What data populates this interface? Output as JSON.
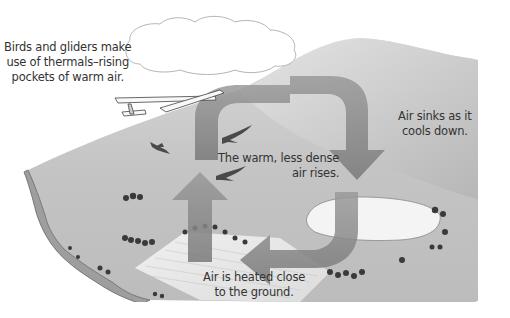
{
  "diagram": {
    "labels": {
      "birds_gliders": [
        "Birds and gliders make",
        "use of thermals–rising",
        "pockets of warm air."
      ],
      "sinks": [
        "Air sinks as it",
        "cools down."
      ],
      "rises": [
        "The warm, less dense",
        "air rises."
      ],
      "heated": [
        "Air is heated close",
        "to the ground."
      ]
    },
    "elements": {
      "cloud": "cumulus-cloud",
      "glider": "glider-aircraft",
      "birds": [
        "bird-1",
        "bird-2",
        "bird-3"
      ],
      "arrows": [
        "arrow-up-rising",
        "arrow-right-top",
        "arrow-down-sinking",
        "arrow-left-bottom"
      ],
      "terrain": [
        "hill",
        "coastal-cliff",
        "lake",
        "ploughed-field",
        "trees"
      ]
    },
    "colors": {
      "background": "#ffffff",
      "terrain": "#c9c9c9",
      "arrow": "#8a8a8a",
      "text": "#333333"
    }
  }
}
